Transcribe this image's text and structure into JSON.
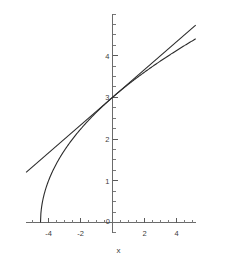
{
  "chart_data": {
    "type": "line",
    "title": "",
    "subtitle": "",
    "xlabel": "x",
    "ylabel": "",
    "xlim": [
      -5.4,
      5.2
    ],
    "ylim": [
      -0.25,
      5.0
    ],
    "grid": false,
    "legend": "none",
    "x_ticks": [
      -4,
      -2,
      0,
      2,
      4
    ],
    "x_tick_labels": [
      "-4",
      "-2",
      "0",
      "2",
      "4"
    ],
    "y_ticks": [
      1,
      2,
      3,
      4
    ],
    "y_tick_labels": [
      "1",
      "2",
      "3",
      "4"
    ],
    "x_minor_tick_step": 0.5,
    "y_minor_tick_step": 0.25,
    "origin_label": "0",
    "series": [
      {
        "name": "curve",
        "expression": "y = sqrt(2x + 9)",
        "style": "solid",
        "color": "#2b2b2b",
        "domain": [
          -4.5,
          5.2
        ],
        "points": [
          {
            "x": -4.5,
            "y": 0.0
          },
          {
            "x": -4.4,
            "y": 0.447
          },
          {
            "x": -4.3,
            "y": 0.632
          },
          {
            "x": -4.2,
            "y": 0.775
          },
          {
            "x": -4.0,
            "y": 1.0
          },
          {
            "x": -3.75,
            "y": 1.225
          },
          {
            "x": -3.5,
            "y": 1.414
          },
          {
            "x": -3.0,
            "y": 1.732
          },
          {
            "x": -2.5,
            "y": 2.0
          },
          {
            "x": -2.0,
            "y": 2.236
          },
          {
            "x": -1.5,
            "y": 2.449
          },
          {
            "x": -1.0,
            "y": 2.646
          },
          {
            "x": -0.5,
            "y": 2.828
          },
          {
            "x": 0.0,
            "y": 3.0
          },
          {
            "x": 0.5,
            "y": 3.162
          },
          {
            "x": 1.0,
            "y": 3.317
          },
          {
            "x": 1.5,
            "y": 3.464
          },
          {
            "x": 2.0,
            "y": 3.606
          },
          {
            "x": 2.5,
            "y": 3.742
          },
          {
            "x": 3.0,
            "y": 3.873
          },
          {
            "x": 3.5,
            "y": 4.0
          },
          {
            "x": 4.0,
            "y": 4.123
          },
          {
            "x": 4.5,
            "y": 4.243
          },
          {
            "x": 5.0,
            "y": 4.359
          },
          {
            "x": 5.2,
            "y": 4.405
          }
        ]
      },
      {
        "name": "tangent-line",
        "expression": "y = 3 + x/3",
        "style": "solid",
        "color": "#2b2b2b",
        "domain": [
          -5.4,
          5.2
        ],
        "tangent_point": {
          "x": 0,
          "y": 3
        },
        "slope": 0.3333,
        "intercept": 3,
        "points": [
          {
            "x": -5.4,
            "y": 1.2
          },
          {
            "x": 0.0,
            "y": 3.0
          },
          {
            "x": 5.2,
            "y": 4.733
          }
        ]
      }
    ],
    "annotations": []
  },
  "axes": {
    "x_axis_name": "x",
    "y_axis_name": ""
  }
}
